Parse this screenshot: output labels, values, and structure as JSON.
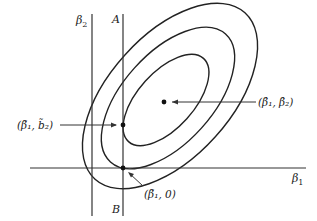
{
  "diagram": {
    "axes": {
      "beta2_label": "β",
      "beta2_sub": "2",
      "beta1_label": "β",
      "beta1_sub": "1"
    },
    "line": {
      "top_label": "A",
      "bottom_label": "B"
    },
    "points": {
      "ols_estimate": {
        "label": "(β̂₁, β̂₂)"
      },
      "constrained_estimate": {
        "label": "(β̃₁, b̃₂)"
      },
      "restricted_estimate": {
        "label": "(β̃₁, 0)"
      }
    },
    "contours": {
      "count": 3,
      "description": "nested confidence ellipses"
    },
    "colors": {
      "ink": "#222222",
      "background": "#ffffff"
    }
  }
}
